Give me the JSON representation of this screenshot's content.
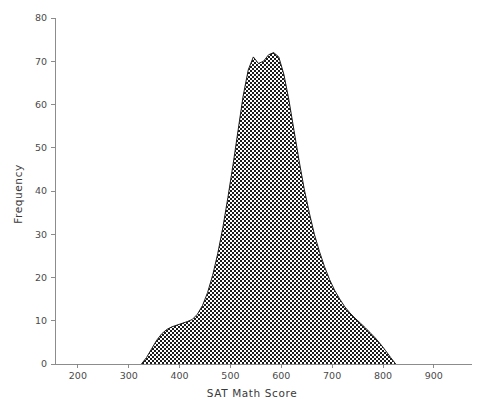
{
  "chart_data": {
    "type": "area",
    "title": "",
    "subtitle": "",
    "xlabel": "SAT Math Score",
    "ylabel": "Frequency",
    "xlim": [
      155,
      975
    ],
    "ylim": [
      0,
      80
    ],
    "grid": false,
    "legend": null,
    "fill_style": "checkerboard-hatch",
    "fill_color": "#000000",
    "line_color": "#1c1c1c",
    "background_color": "#ffffff",
    "xticks": [
      200,
      300,
      400,
      500,
      600,
      700,
      800,
      900
    ],
    "xticklabels": [
      "200",
      "300",
      "400",
      "500",
      "600",
      "700",
      "800",
      "900"
    ],
    "yticks": [
      0,
      10,
      20,
      30,
      40,
      50,
      60,
      70,
      80
    ],
    "yticklabels": [
      "0",
      "10",
      "20",
      "30",
      "40",
      "50",
      "60",
      "70",
      "80"
    ],
    "x": [
      325,
      335,
      345,
      355,
      365,
      375,
      385,
      395,
      405,
      415,
      425,
      435,
      445,
      455,
      465,
      475,
      485,
      495,
      505,
      515,
      525,
      535,
      545,
      555,
      565,
      575,
      585,
      595,
      605,
      615,
      625,
      635,
      645,
      655,
      665,
      675,
      685,
      695,
      705,
      715,
      725,
      735,
      745,
      755,
      765,
      775,
      785,
      795,
      805,
      815,
      825
    ],
    "values": [
      0,
      1.5,
      3.5,
      5.5,
      7.0,
      8.0,
      8.6,
      9.0,
      9.4,
      9.8,
      10.3,
      11.5,
      13.5,
      16.5,
      20.5,
      25.5,
      31.5,
      38.5,
      46.0,
      54.0,
      62.0,
      68.0,
      71.0,
      69.5,
      70.0,
      71.5,
      72.0,
      71.0,
      67.0,
      61.0,
      54.0,
      47.0,
      40.5,
      35.0,
      30.0,
      26.0,
      22.5,
      19.5,
      17.0,
      15.0,
      13.2,
      11.8,
      10.6,
      9.5,
      8.4,
      7.2,
      6.0,
      4.6,
      3.1,
      1.5,
      0
    ]
  },
  "axis": {
    "x_title": "SAT Math Score",
    "y_title": "Frequency"
  }
}
